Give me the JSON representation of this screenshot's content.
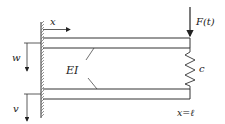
{
  "diagram": {
    "labels": {
      "x_axis": "x",
      "force": "F(t)",
      "stiffness_beam": "EI",
      "spring": "c",
      "w_disp": "w",
      "v_disp": "v",
      "end_position": "x=ℓ"
    },
    "colors": {
      "line": "#333333",
      "hatch": "#666666",
      "background": "#ffffff"
    }
  }
}
